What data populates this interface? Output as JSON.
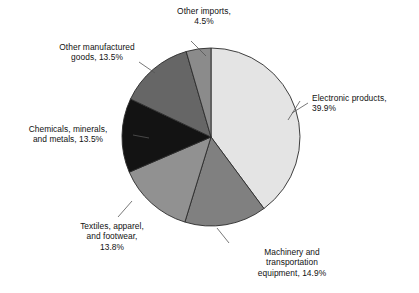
{
  "chart_data": {
    "type": "pie",
    "title": "",
    "subtitle": "",
    "xlabel": "",
    "ylabel": "",
    "legend_position": "none",
    "grid": false,
    "start_angle_deg": 0,
    "direction": "clockwise",
    "categories": [
      "Electronic products",
      "Machinery and transportation equipment",
      "Textiles, apparel, and footwear",
      "Chemicals, minerals, and metals",
      "Other manufactured goods",
      "Other imports"
    ],
    "values": [
      39.9,
      14.9,
      13.8,
      13.5,
      13.5,
      4.5
    ],
    "value_unit": "%",
    "slices": [
      {
        "name": "Electronic products",
        "value": 39.9,
        "value_text": "39.9%",
        "label_text": "Electronic products,\n39.9%",
        "color": "#e4e4e4"
      },
      {
        "name": "Machinery and transportation equipment",
        "value": 14.9,
        "value_text": "14.9%",
        "label_text": "Machinery and\ntransportation\nequipment, 14.9%",
        "color": "#808080"
      },
      {
        "name": "Textiles, apparel, and footwear",
        "value": 13.8,
        "value_text": "13.8%",
        "label_text": "Textiles, apparel,\nand footwear,\n13.8%",
        "color": "#919191"
      },
      {
        "name": "Chemicals, minerals, and metals",
        "value": 13.5,
        "value_text": "13.5%",
        "label_text": "Chemicals, minerals,\nand metals, 13.5%",
        "color": "#131313"
      },
      {
        "name": "Other manufactured goods",
        "value": 13.5,
        "value_text": "13.5%",
        "label_text": "Other manufactured\ngoods, 13.5%",
        "color": "#666666"
      },
      {
        "name": "Other imports",
        "value": 4.5,
        "value_text": "4.5%",
        "label_text": "Other imports,\n4.5%",
        "color": "#8b8b8b"
      }
    ]
  },
  "style": {
    "background": "#ffffff",
    "slice_outline": "#2b2b2b",
    "leader_line": "#555555",
    "text": "#111111"
  }
}
